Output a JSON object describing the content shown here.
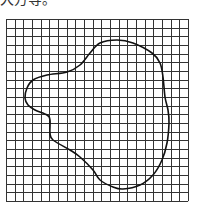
{
  "caption": "大方等。",
  "figure": {
    "grid": {
      "left": 6,
      "top": 19,
      "cols": 21,
      "rows": 21,
      "cell": 8.67,
      "line_color": "#333333",
      "line_width": 1
    },
    "shape": {
      "description": "irregular closed blob outline drawn on square grid",
      "stroke_color": "#111111",
      "stroke_width": 1.6,
      "points": [
        [
          100,
          43
        ],
        [
          117,
          40
        ],
        [
          133,
          43
        ],
        [
          152,
          53
        ],
        [
          160,
          63
        ],
        [
          163,
          77
        ],
        [
          165,
          97
        ],
        [
          168,
          110
        ],
        [
          169,
          123
        ],
        [
          167,
          143
        ],
        [
          162,
          160
        ],
        [
          153,
          175
        ],
        [
          140,
          185
        ],
        [
          123,
          189
        ],
        [
          113,
          187
        ],
        [
          100,
          180
        ],
        [
          93,
          170
        ],
        [
          80,
          157
        ],
        [
          70,
          150
        ],
        [
          53,
          140
        ],
        [
          50,
          133
        ],
        [
          50,
          120
        ],
        [
          47,
          115
        ],
        [
          35,
          110
        ],
        [
          28,
          105
        ],
        [
          25,
          98
        ],
        [
          27,
          88
        ],
        [
          33,
          80
        ],
        [
          47,
          75
        ],
        [
          67,
          72
        ],
        [
          80,
          65
        ],
        [
          90,
          53
        ]
      ]
    }
  }
}
